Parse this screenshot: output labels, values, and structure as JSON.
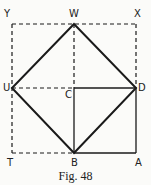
{
  "figure": {
    "caption": "Fig. 48",
    "points": {
      "Y": {
        "label": "Y",
        "x": 12,
        "y": 24
      },
      "W": {
        "label": "W",
        "x": 74,
        "y": 24
      },
      "X": {
        "label": "X",
        "x": 136,
        "y": 24
      },
      "U": {
        "label": "U",
        "x": 12,
        "y": 88
      },
      "C": {
        "label": "C",
        "x": 74,
        "y": 88
      },
      "D": {
        "label": "D",
        "x": 136,
        "y": 88
      },
      "T": {
        "label": "T",
        "x": 12,
        "y": 153
      },
      "B": {
        "label": "B",
        "x": 74,
        "y": 153
      },
      "A": {
        "label": "A",
        "x": 136,
        "y": 153
      }
    },
    "solid_segments": [
      [
        "W",
        "D"
      ],
      [
        "D",
        "B"
      ],
      [
        "B",
        "U"
      ],
      [
        "U",
        "W"
      ],
      [
        "C",
        "D"
      ],
      [
        "C",
        "B"
      ],
      [
        "D",
        "A"
      ],
      [
        "B",
        "A"
      ]
    ],
    "dashed_segments": [
      [
        "Y",
        "X"
      ],
      [
        "Y",
        "T"
      ],
      [
        "T",
        "B"
      ],
      [
        "X",
        "D"
      ],
      [
        "W",
        "C"
      ],
      [
        "U",
        "C"
      ]
    ],
    "colors": {
      "line": "#1a1a1a",
      "background": "#fbfbf9"
    }
  }
}
